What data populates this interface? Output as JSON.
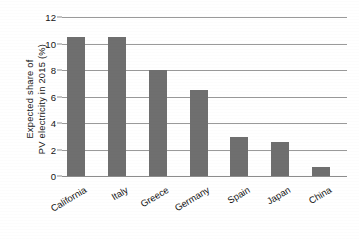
{
  "chart_data": {
    "type": "bar",
    "title": "",
    "xlabel": "",
    "ylabel_line1": "Expected  share of",
    "ylabel_line2": "PV electricity in 2015 (%)",
    "ylabel": "Expected share of PV electricity in 2015 (%)",
    "categories": [
      "California",
      "Italy",
      "Greece",
      "Germany",
      "Spain",
      "Japan",
      "China"
    ],
    "values": [
      10.5,
      10.5,
      8.0,
      6.5,
      2.95,
      2.6,
      0.7
    ],
    "ylim": [
      0,
      12
    ],
    "yticks": [
      0,
      2,
      4,
      6,
      8,
      10,
      12
    ],
    "ytick_labels": [
      "0",
      "2",
      "4",
      "6",
      "8",
      "10",
      "12"
    ],
    "grid": true,
    "legend": "none",
    "bar_color": "#6f6f6f",
    "grid_color": "#9a9a9a",
    "background": "#ffffff"
  }
}
